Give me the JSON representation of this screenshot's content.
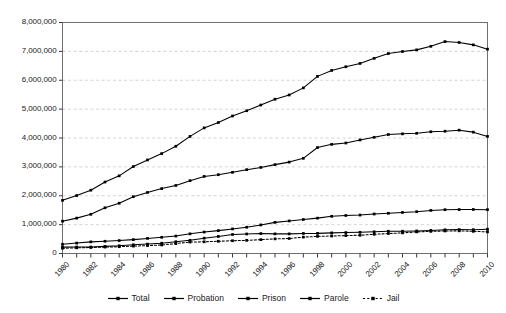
{
  "chart_data": {
    "type": "line",
    "title": "",
    "subtitle": "",
    "xlabel": "",
    "ylabel": "",
    "xlim": [
      1980,
      2010
    ],
    "ylim": [
      0,
      8000000
    ],
    "ytick_step": 1000000,
    "grid": true,
    "grid_axis": "y",
    "legend_position": "bottom",
    "x": [
      1980,
      1981,
      1982,
      1983,
      1984,
      1985,
      1986,
      1987,
      1988,
      1989,
      1990,
      1991,
      1992,
      1993,
      1994,
      1995,
      1996,
      1997,
      1998,
      1999,
      2000,
      2001,
      2002,
      2003,
      2004,
      2005,
      2006,
      2007,
      2008,
      2009,
      2010
    ],
    "xtick_labels": [
      "1980",
      "1982",
      "1984",
      "1986",
      "1988",
      "1990",
      "1992",
      "1994",
      "1996",
      "1998",
      "2000",
      "2002",
      "2004",
      "2006",
      "2008",
      "2010"
    ],
    "ytick_labels": [
      "0",
      "1,000,000",
      "2,000,000",
      "3,000,000",
      "4,000,000",
      "5,000,000",
      "6,000,000",
      "7,000,000",
      "8,000,000"
    ],
    "series": [
      {
        "name": "Total",
        "style": "solid",
        "marker": "square",
        "color": "#000000",
        "values": [
          1840400,
          2006600,
          2192600,
          2475100,
          2689200,
          3011500,
          3239400,
          3459600,
          3714100,
          4055300,
          4350300,
          4535600,
          4762600,
          4944000,
          5141300,
          5342900,
          5490700,
          5734900,
          6134200,
          6340800,
          6467200,
          6581700,
          6758300,
          6924500,
          6995100,
          7051900,
          7175100,
          7339600,
          7308200,
          7225800,
          7076200
        ]
      },
      {
        "name": "Probation",
        "style": "solid",
        "marker": "square",
        "color": "#000000",
        "values": [
          1118100,
          1225000,
          1357300,
          1582900,
          1740900,
          1968700,
          2114600,
          2247200,
          2356500,
          2522100,
          2670200,
          2728500,
          2811600,
          2903100,
          2981000,
          3077900,
          3164900,
          3296500,
          3670400,
          3779900,
          3826200,
          3931700,
          4024100,
          4120000,
          4143800,
          4162500,
          4215400,
          4234500,
          4271100,
          4203000,
          4055500
        ]
      },
      {
        "name": "Prison",
        "style": "solid",
        "marker": "square",
        "color": "#000000",
        "values": [
          319600,
          360000,
          402900,
          423900,
          448300,
          480600,
          522900,
          560800,
          603700,
          680400,
          743000,
          792500,
          850600,
          909400,
          990100,
          1078500,
          1127500,
          1176600,
          1224500,
          1287200,
          1316300,
          1330900,
          1367500,
          1392800,
          1421300,
          1448300,
          1492000,
          1517100,
          1521000,
          1524500,
          1518100
        ]
      },
      {
        "name": "Parole",
        "style": "solid",
        "marker": "square",
        "color": "#000000",
        "values": [
          220400,
          225500,
          224600,
          246400,
          266900,
          300200,
          325600,
          355500,
          407900,
          456800,
          531400,
          590500,
          658600,
          676100,
          690400,
          679400,
          679700,
          694800,
          696400,
          714400,
          725000,
          733000,
          750900,
          769900,
          771600,
          780600,
          799900,
          821200,
          828200,
          824400,
          840700
        ]
      },
      {
        "name": "Jail",
        "style": "dotted",
        "marker": "square",
        "color": "#000000",
        "values": [
          182300,
          196000,
          207900,
          221800,
          234500,
          256600,
          274400,
          295900,
          343600,
          395600,
          405300,
          424100,
          441800,
          455500,
          479800,
          507000,
          518500,
          567100,
          592500,
          605900,
          621100,
          631200,
          665500,
          691300,
          713990,
          747500,
          765800,
          780200,
          785500,
          767400,
          748700
        ]
      }
    ]
  }
}
